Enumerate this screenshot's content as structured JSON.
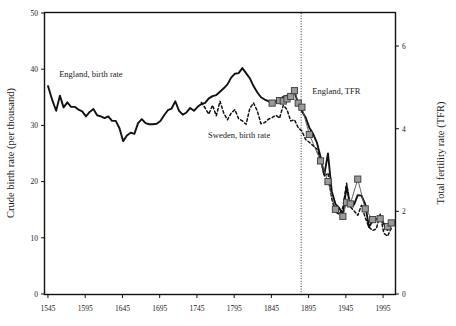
{
  "chart_data": {
    "type": "line",
    "title": "",
    "subtitle": "",
    "xlabel": "",
    "ylabel": "Crude birth rate (per thousand)",
    "y2label": "Total fertility rate (TFR)",
    "xlim": [
      1541,
      2011
    ],
    "ylim": [
      0,
      50
    ],
    "y2lim": [
      0,
      6.8
    ],
    "grid": false,
    "legend_position": "inline-annotations",
    "xticks": [
      1545,
      1595,
      1645,
      1695,
      1745,
      1795,
      1845,
      1895,
      1945,
      1995
    ],
    "xtick_labels": [
      "1545",
      "1595",
      "1645",
      "1695",
      "1745",
      "1795",
      "1845",
      "1895",
      "1945",
      "1995"
    ],
    "yticks": [
      0,
      10,
      20,
      30,
      40,
      50
    ],
    "ytick_labels": [
      "0",
      "10",
      "20",
      "30",
      "40",
      "50"
    ],
    "y2ticks": [
      0,
      2,
      4,
      6
    ],
    "y2tick_labels": [
      "0",
      "2",
      "4",
      "6"
    ],
    "annotations": [
      {
        "text": "England, birth rate",
        "x": 1560,
        "y": 38.6,
        "name": "england-birth-rate-label"
      },
      {
        "text": "Sweden, birth rate",
        "x": 1760,
        "y": 27.8,
        "name": "sweden-birth-rate-label"
      },
      {
        "text": "England, TFR",
        "x": 1900,
        "y": 35.6,
        "name": "england-tfr-label"
      }
    ],
    "reference_line": {
      "x": 1885,
      "style": "dotted",
      "name": "reference-vline-1885"
    },
    "series": [
      {
        "name": "England, birth rate",
        "axis": "left",
        "style": "solid",
        "color": "#111111",
        "points": [
          [
            1545,
            37.0
          ],
          [
            1551,
            34.4
          ],
          [
            1556,
            32.6
          ],
          [
            1561,
            35.3
          ],
          [
            1566,
            33.2
          ],
          [
            1571,
            34.1
          ],
          [
            1576,
            33.3
          ],
          [
            1581,
            33.3
          ],
          [
            1586,
            32.8
          ],
          [
            1591,
            32.5
          ],
          [
            1596,
            31.6
          ],
          [
            1601,
            32.4
          ],
          [
            1606,
            32.9
          ],
          [
            1611,
            31.8
          ],
          [
            1616,
            31.6
          ],
          [
            1621,
            31.3
          ],
          [
            1626,
            31.6
          ],
          [
            1631,
            30.8
          ],
          [
            1636,
            30.8
          ],
          [
            1641,
            29.5
          ],
          [
            1646,
            27.2
          ],
          [
            1651,
            28.2
          ],
          [
            1656,
            28.7
          ],
          [
            1661,
            28.5
          ],
          [
            1666,
            30.4
          ],
          [
            1671,
            31.1
          ],
          [
            1676,
            30.4
          ],
          [
            1681,
            30.2
          ],
          [
            1686,
            30.2
          ],
          [
            1691,
            30.3
          ],
          [
            1696,
            30.8
          ],
          [
            1701,
            31.8
          ],
          [
            1706,
            32.7
          ],
          [
            1711,
            33.0
          ],
          [
            1716,
            34.3
          ],
          [
            1721,
            32.6
          ],
          [
            1726,
            31.9
          ],
          [
            1731,
            32.3
          ],
          [
            1736,
            33.1
          ],
          [
            1741,
            32.6
          ],
          [
            1746,
            33.3
          ],
          [
            1751,
            33.8
          ],
          [
            1756,
            34.0
          ],
          [
            1761,
            34.8
          ],
          [
            1766,
            35.2
          ],
          [
            1771,
            35.4
          ],
          [
            1776,
            36.0
          ],
          [
            1781,
            36.6
          ],
          [
            1786,
            37.3
          ],
          [
            1791,
            38.5
          ],
          [
            1796,
            39.2
          ],
          [
            1801,
            39.3
          ],
          [
            1806,
            40.2
          ],
          [
            1811,
            39.3
          ],
          [
            1816,
            38.4
          ],
          [
            1821,
            37.0
          ],
          [
            1826,
            35.9
          ],
          [
            1831,
            35.0
          ],
          [
            1836,
            34.6
          ],
          [
            1841,
            34.3
          ],
          [
            1846,
            34.2
          ],
          [
            1851,
            34.3
          ],
          [
            1856,
            34.6
          ],
          [
            1861,
            35.1
          ],
          [
            1866,
            35.3
          ],
          [
            1871,
            35.5
          ],
          [
            1876,
            36.0
          ],
          [
            1881,
            33.9
          ],
          [
            1886,
            32.5
          ],
          [
            1891,
            31.4
          ],
          [
            1896,
            29.6
          ],
          [
            1901,
            28.5
          ],
          [
            1906,
            27.0
          ],
          [
            1911,
            24.4
          ],
          [
            1916,
            21.2
          ],
          [
            1921,
            25.0
          ],
          [
            1926,
            18.3
          ],
          [
            1931,
            16.0
          ],
          [
            1936,
            15.3
          ],
          [
            1941,
            14.2
          ],
          [
            1946,
            19.2
          ],
          [
            1951,
            15.6
          ],
          [
            1956,
            15.9
          ],
          [
            1961,
            17.6
          ],
          [
            1966,
            17.5
          ],
          [
            1971,
            16.0
          ],
          [
            1976,
            11.9
          ],
          [
            1981,
            13.0
          ],
          [
            1986,
            13.3
          ],
          [
            1991,
            13.7
          ],
          [
            1996,
            12.5
          ],
          [
            2001,
            11.4
          ],
          [
            2006,
            12.4
          ]
        ]
      },
      {
        "name": "Sweden, birth rate",
        "axis": "left",
        "style": "dotted",
        "color": "#111111",
        "points": [
          [
            1751,
            34.1
          ],
          [
            1756,
            33.1
          ],
          [
            1761,
            32.0
          ],
          [
            1766,
            33.6
          ],
          [
            1771,
            31.7
          ],
          [
            1776,
            34.3
          ],
          [
            1781,
            32.2
          ],
          [
            1786,
            31.0
          ],
          [
            1791,
            32.2
          ],
          [
            1796,
            32.8
          ],
          [
            1801,
            31.2
          ],
          [
            1806,
            30.8
          ],
          [
            1811,
            30.2
          ],
          [
            1816,
            33.0
          ],
          [
            1821,
            34.0
          ],
          [
            1826,
            32.6
          ],
          [
            1831,
            30.3
          ],
          [
            1836,
            30.5
          ],
          [
            1841,
            31.1
          ],
          [
            1846,
            31.4
          ],
          [
            1851,
            31.8
          ],
          [
            1856,
            31.3
          ],
          [
            1861,
            33.6
          ],
          [
            1866,
            32.8
          ],
          [
            1871,
            30.8
          ],
          [
            1876,
            31.0
          ],
          [
            1881,
            29.6
          ],
          [
            1886,
            29.0
          ],
          [
            1891,
            27.5
          ],
          [
            1896,
            27.0
          ],
          [
            1901,
            26.4
          ],
          [
            1906,
            25.8
          ],
          [
            1911,
            24.0
          ],
          [
            1916,
            21.0
          ],
          [
            1921,
            21.5
          ],
          [
            1926,
            17.0
          ],
          [
            1931,
            14.6
          ],
          [
            1936,
            14.2
          ],
          [
            1941,
            15.4
          ],
          [
            1946,
            19.7
          ],
          [
            1951,
            15.5
          ],
          [
            1956,
            14.8
          ],
          [
            1961,
            14.0
          ],
          [
            1966,
            15.8
          ],
          [
            1971,
            13.6
          ],
          [
            1976,
            11.9
          ],
          [
            1981,
            11.3
          ],
          [
            1986,
            11.6
          ],
          [
            1991,
            14.3
          ],
          [
            1996,
            10.8
          ],
          [
            2001,
            10.3
          ],
          [
            2006,
            11.7
          ]
        ]
      },
      {
        "name": "England, TFR",
        "axis": "right",
        "style": "solid-with-square-markers",
        "color": "#555555",
        "marker": "square",
        "marker_fill": "#9a9a9a",
        "points": [
          [
            1846,
            4.62
          ],
          [
            1856,
            4.68
          ],
          [
            1861,
            4.67
          ],
          [
            1866,
            4.72
          ],
          [
            1871,
            4.78
          ],
          [
            1876,
            4.92
          ],
          [
            1881,
            4.62
          ],
          [
            1886,
            4.52
          ],
          [
            1896,
            3.86
          ],
          [
            1911,
            3.22
          ],
          [
            1921,
            2.72
          ],
          [
            1931,
            2.05
          ],
          [
            1941,
            1.88
          ],
          [
            1946,
            2.22
          ],
          [
            1951,
            2.18
          ],
          [
            1961,
            2.78
          ],
          [
            1971,
            2.06
          ],
          [
            1981,
            1.8
          ],
          [
            1991,
            1.82
          ],
          [
            2001,
            1.63
          ],
          [
            2006,
            1.72
          ]
        ]
      }
    ]
  },
  "axes": {
    "left_title": "Crude birth rate (per thousand)",
    "right_title": "Total fertility rate (TFR)"
  }
}
